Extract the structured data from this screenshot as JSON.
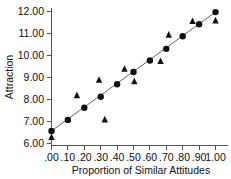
{
  "chart_data": {
    "type": "scatter",
    "title": "",
    "xlabel": "Proportion of Similar Attitudes",
    "ylabel": "Attraction",
    "xlim": [
      -0.04,
      1.05
    ],
    "ylim": [
      5.9,
      12.2
    ],
    "grid": false,
    "legend": "none",
    "xticks": [
      0.0,
      0.1,
      0.2,
      0.3,
      0.4,
      0.5,
      0.6,
      0.7,
      0.8,
      0.9,
      1.0
    ],
    "xtick_labels": [
      ".00",
      ".10",
      ".20",
      ".30",
      ".40",
      ".50",
      ".60",
      ".70",
      ".80",
      ".90",
      "1.00"
    ],
    "yticks": [
      6.0,
      7.0,
      8.0,
      9.0,
      10.0,
      11.0,
      12.0
    ],
    "ytick_labels": [
      "6.00",
      "7.00",
      "8.00",
      "9.00",
      "10.00",
      "11.00",
      "12.00"
    ],
    "series": [
      {
        "name": "predicted",
        "marker": "circle",
        "color": "#111111",
        "points": [
          {
            "x": 0.0,
            "y": 6.55
          },
          {
            "x": 0.1,
            "y": 7.05
          },
          {
            "x": 0.2,
            "y": 7.6
          },
          {
            "x": 0.3,
            "y": 8.1
          },
          {
            "x": 0.4,
            "y": 8.67
          },
          {
            "x": 0.5,
            "y": 9.23
          },
          {
            "x": 0.6,
            "y": 9.75
          },
          {
            "x": 0.7,
            "y": 10.28
          },
          {
            "x": 0.8,
            "y": 10.85
          },
          {
            "x": 0.9,
            "y": 11.4
          },
          {
            "x": 1.0,
            "y": 11.95
          }
        ]
      },
      {
        "name": "observed",
        "marker": "triangle",
        "color": "#111111",
        "points": [
          {
            "x": 0.0,
            "y": 6.25
          },
          {
            "x": 0.155,
            "y": 8.15
          },
          {
            "x": 0.29,
            "y": 8.85
          },
          {
            "x": 0.325,
            "y": 7.05
          },
          {
            "x": 0.445,
            "y": 9.35
          },
          {
            "x": 0.505,
            "y": 8.78
          },
          {
            "x": 0.665,
            "y": 9.7
          },
          {
            "x": 0.715,
            "y": 10.9
          },
          {
            "x": 0.86,
            "y": 11.52
          },
          {
            "x": 1.0,
            "y": 11.55
          }
        ]
      }
    ],
    "fit_line": {
      "name": "regression-line",
      "color": "#666666",
      "x0": 0.0,
      "y0": 6.55,
      "x1": 1.0,
      "y1": 11.95
    }
  }
}
